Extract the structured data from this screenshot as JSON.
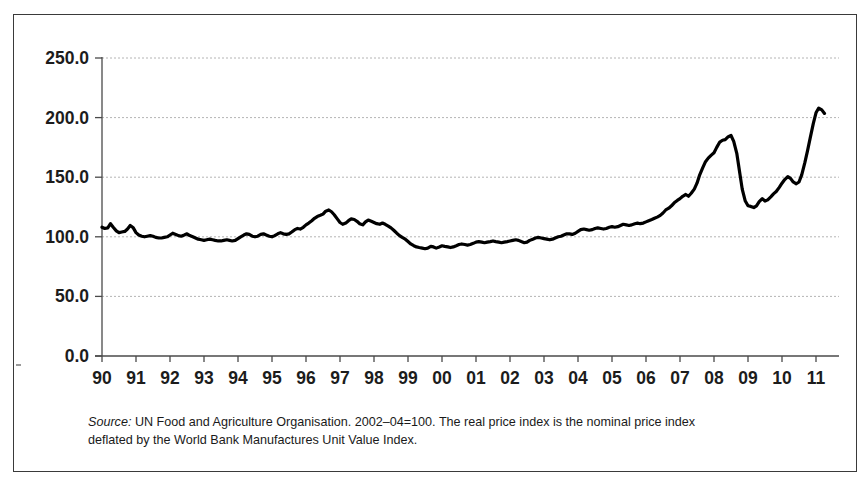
{
  "chart_data": {
    "type": "line",
    "title": "",
    "subtitle": "",
    "xlabel": "",
    "ylabel": "",
    "xlim": [
      1990.0,
      2011.25
    ],
    "ylim": [
      0.0,
      250.0
    ],
    "grid": true,
    "grid_axis": "y",
    "legend": "none",
    "line_color": "#000000",
    "grid_color": "#b4b4b4",
    "axis_color": "#4a4a4a",
    "ytick_labels": [
      "0.0",
      "50.0",
      "100.0",
      "150.0",
      "200.0",
      "250.0"
    ],
    "ytick_values": [
      0,
      50,
      100,
      150,
      200,
      250
    ],
    "xtick_labels": [
      "90",
      "91",
      "92",
      "93",
      "94",
      "95",
      "96",
      "97",
      "98",
      "99",
      "00",
      "01",
      "02",
      "03",
      "04",
      "05",
      "06",
      "07",
      "08",
      "09",
      "10",
      "11"
    ],
    "xtick_values": [
      1990,
      1991,
      1992,
      1993,
      1994,
      1995,
      1996,
      1997,
      1998,
      1999,
      2000,
      2001,
      2002,
      2003,
      2004,
      2005,
      2006,
      2007,
      2008,
      2009,
      2010,
      2011
    ],
    "series": [
      {
        "name": "Real food price index",
        "x": [
          1990.0,
          1990.08,
          1990.17,
          1990.25,
          1990.33,
          1990.42,
          1990.5,
          1990.58,
          1990.67,
          1990.75,
          1990.83,
          1990.92,
          1991.0,
          1991.08,
          1991.17,
          1991.25,
          1991.33,
          1991.42,
          1991.5,
          1991.58,
          1991.67,
          1991.75,
          1991.83,
          1991.92,
          1992.0,
          1992.08,
          1992.17,
          1992.25,
          1992.33,
          1992.42,
          1992.5,
          1992.58,
          1992.67,
          1992.75,
          1992.83,
          1992.92,
          1993.0,
          1993.08,
          1993.17,
          1993.25,
          1993.33,
          1993.42,
          1993.5,
          1993.58,
          1993.67,
          1993.75,
          1993.83,
          1993.92,
          1994.0,
          1994.08,
          1994.17,
          1994.25,
          1994.33,
          1994.42,
          1994.5,
          1994.58,
          1994.67,
          1994.75,
          1994.83,
          1994.92,
          1995.0,
          1995.08,
          1995.17,
          1995.25,
          1995.33,
          1995.42,
          1995.5,
          1995.58,
          1995.67,
          1995.75,
          1995.83,
          1995.92,
          1996.0,
          1996.08,
          1996.17,
          1996.25,
          1996.33,
          1996.42,
          1996.5,
          1996.58,
          1996.67,
          1996.75,
          1996.83,
          1996.92,
          1997.0,
          1997.08,
          1997.17,
          1997.25,
          1997.33,
          1997.42,
          1997.5,
          1997.58,
          1997.67,
          1997.75,
          1997.83,
          1997.92,
          1998.0,
          1998.08,
          1998.17,
          1998.25,
          1998.33,
          1998.42,
          1998.5,
          1998.58,
          1998.67,
          1998.75,
          1998.83,
          1998.92,
          1999.0,
          1999.08,
          1999.17,
          1999.25,
          1999.33,
          1999.42,
          1999.5,
          1999.58,
          1999.67,
          1999.75,
          1999.83,
          1999.92,
          2000.0,
          2000.08,
          2000.17,
          2000.25,
          2000.33,
          2000.42,
          2000.5,
          2000.58,
          2000.67,
          2000.75,
          2000.83,
          2000.92,
          2001.0,
          2001.08,
          2001.17,
          2001.25,
          2001.33,
          2001.42,
          2001.5,
          2001.58,
          2001.67,
          2001.75,
          2001.83,
          2001.92,
          2002.0,
          2002.08,
          2002.17,
          2002.25,
          2002.33,
          2002.42,
          2002.5,
          2002.58,
          2002.67,
          2002.75,
          2002.83,
          2002.92,
          2003.0,
          2003.08,
          2003.17,
          2003.25,
          2003.33,
          2003.42,
          2003.5,
          2003.58,
          2003.67,
          2003.75,
          2003.83,
          2003.92,
          2004.0,
          2004.08,
          2004.17,
          2004.25,
          2004.33,
          2004.42,
          2004.5,
          2004.58,
          2004.67,
          2004.75,
          2004.83,
          2004.92,
          2005.0,
          2005.08,
          2005.17,
          2005.25,
          2005.33,
          2005.42,
          2005.5,
          2005.58,
          2005.67,
          2005.75,
          2005.83,
          2005.92,
          2006.0,
          2006.08,
          2006.17,
          2006.25,
          2006.33,
          2006.42,
          2006.5,
          2006.58,
          2006.67,
          2006.75,
          2006.83,
          2006.92,
          2007.0,
          2007.08,
          2007.17,
          2007.25,
          2007.33,
          2007.42,
          2007.5,
          2007.58,
          2007.67,
          2007.75,
          2007.83,
          2007.92,
          2008.0,
          2008.08,
          2008.17,
          2008.25,
          2008.33,
          2008.42,
          2008.5,
          2008.58,
          2008.67,
          2008.75,
          2008.83,
          2008.92,
          2009.0,
          2009.08,
          2009.17,
          2009.25,
          2009.33,
          2009.42,
          2009.5,
          2009.58,
          2009.67,
          2009.75,
          2009.83,
          2009.92,
          2010.0,
          2010.08,
          2010.17,
          2010.25,
          2010.33,
          2010.42,
          2010.5,
          2010.58,
          2010.67,
          2010.75,
          2010.83,
          2010.92,
          2011.0,
          2011.08,
          2011.17,
          2011.25
        ],
        "values": [
          108.0,
          107.0,
          107.5,
          111.0,
          108.0,
          105.0,
          103.5,
          104.0,
          104.5,
          106.5,
          109.5,
          107.5,
          103.5,
          101.5,
          100.5,
          100.0,
          100.5,
          101.0,
          100.5,
          99.5,
          99.0,
          99.0,
          99.5,
          100.0,
          101.5,
          103.0,
          102.0,
          101.0,
          100.5,
          101.5,
          102.5,
          101.0,
          100.0,
          99.0,
          98.0,
          97.5,
          97.0,
          97.5,
          98.0,
          97.5,
          97.0,
          96.5,
          96.5,
          97.0,
          97.5,
          97.0,
          96.5,
          97.0,
          98.5,
          100.0,
          101.5,
          102.5,
          102.0,
          100.5,
          100.0,
          100.5,
          102.0,
          102.5,
          101.5,
          100.5,
          100.0,
          101.0,
          102.5,
          103.5,
          102.5,
          102.0,
          102.5,
          104.0,
          106.0,
          107.0,
          106.5,
          108.0,
          110.0,
          111.5,
          113.5,
          115.5,
          117.0,
          118.0,
          119.0,
          121.5,
          122.5,
          121.0,
          118.5,
          115.0,
          112.0,
          110.5,
          111.5,
          113.5,
          115.0,
          114.5,
          113.0,
          111.0,
          110.0,
          112.5,
          114.0,
          113.0,
          112.0,
          111.0,
          110.5,
          111.5,
          110.5,
          109.0,
          107.5,
          105.5,
          103.0,
          101.0,
          99.5,
          98.0,
          96.0,
          94.0,
          92.5,
          91.5,
          91.0,
          90.5,
          90.0,
          90.5,
          92.0,
          91.5,
          90.5,
          91.5,
          92.5,
          92.0,
          91.5,
          91.0,
          91.5,
          92.5,
          93.5,
          94.0,
          93.5,
          93.0,
          93.5,
          94.5,
          95.5,
          96.0,
          95.5,
          95.0,
          95.5,
          96.0,
          96.5,
          96.0,
          95.5,
          95.0,
          95.5,
          96.0,
          96.5,
          97.0,
          97.5,
          97.0,
          96.0,
          95.0,
          95.5,
          97.0,
          98.0,
          99.0,
          99.5,
          99.0,
          98.5,
          98.0,
          97.5,
          98.0,
          99.0,
          100.0,
          100.5,
          101.5,
          102.5,
          102.5,
          102.0,
          103.0,
          104.5,
          106.0,
          106.5,
          106.0,
          105.5,
          106.0,
          107.0,
          107.5,
          107.0,
          106.5,
          107.0,
          108.0,
          108.5,
          108.0,
          108.5,
          109.5,
          110.5,
          110.0,
          109.5,
          110.0,
          111.0,
          111.5,
          111.0,
          111.5,
          112.5,
          113.5,
          114.5,
          115.5,
          116.5,
          118.0,
          120.0,
          122.5,
          124.0,
          126.0,
          128.5,
          130.5,
          132.0,
          134.0,
          135.5,
          134.0,
          136.5,
          140.0,
          145.0,
          152.0,
          158.0,
          163.0,
          166.0,
          168.5,
          170.5,
          175.0,
          179.5,
          181.0,
          181.5,
          184.0,
          185.0,
          180.0,
          170.0,
          155.0,
          140.0,
          130.0,
          126.0,
          125.5,
          124.5,
          126.0,
          129.5,
          132.0,
          130.0,
          131.0,
          133.5,
          136.0,
          138.0,
          141.5,
          145.0,
          148.0,
          150.5,
          149.0,
          146.0,
          144.5,
          146.0,
          152.0,
          162.0,
          172.0,
          183.0,
          195.0,
          204.0,
          208.0,
          206.5,
          203.5
        ]
      }
    ],
    "annotations": [],
    "source_note_line1_prefix": "Source:",
    "source_note_line1": " UN Food and Agriculture Organisation. 2002–04=100. The real price index is the",
    "source_note_line2": "nominal price index deflated by the World Bank Manufactures Unit Value Index."
  },
  "figure": {
    "border_color": "#3a3a3a",
    "background": "#ffffff"
  },
  "source": {
    "label": "Source:",
    "line1": " UN Food and Agriculture Organisation. 2002–04=100. The real price index is the",
    "line2": "nominal price index deflated by the World Bank Manufactures Unit Value Index."
  }
}
